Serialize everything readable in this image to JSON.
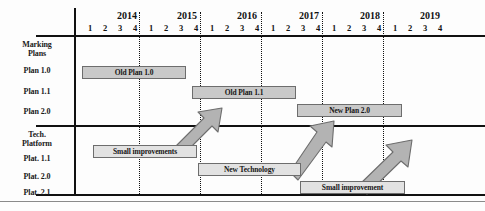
{
  "diagram": {
    "axis": {
      "years": [
        "2014",
        "2015",
        "2016",
        "2017",
        "2018",
        "2019"
      ],
      "quarters": [
        "1",
        "2",
        "3",
        "4"
      ]
    },
    "groups": [
      {
        "name": "marking-plans",
        "label_line1": "Marking",
        "label_line2": "Plans",
        "rows": [
          {
            "label": "Plan 1.0"
          },
          {
            "label": "Plan 1.1"
          },
          {
            "label": "Plan 2.0"
          }
        ]
      },
      {
        "name": "tech-platform",
        "label_line1": "Tech.",
        "label_line2": "Platform",
        "rows": [
          {
            "label": "Plat. 1.1"
          },
          {
            "label": "Plat. 2.0"
          },
          {
            "label": "Plat. 2.1"
          }
        ]
      }
    ],
    "bars": [
      {
        "name": "bar-old-plan-1-0",
        "label": "Old Plan 1.0",
        "row": "Plan 1.0",
        "tone": "dark",
        "x": 82,
        "y": 66,
        "w": 104
      },
      {
        "name": "bar-old-plan-1-1",
        "label": "Old Plan 1.1",
        "row": "Plan 1.1",
        "tone": "dark",
        "x": 192,
        "y": 86,
        "w": 104
      },
      {
        "name": "bar-new-plan-2-0",
        "label": "New Plan 2.0",
        "row": "Plan 2.0",
        "tone": "dark",
        "x": 297,
        "y": 104,
        "w": 105
      },
      {
        "name": "bar-small-improvements",
        "label": "Small improvements",
        "row": "Plat. 1.1",
        "tone": "light",
        "x": 93,
        "y": 145,
        "w": 104
      },
      {
        "name": "bar-new-technology",
        "label": "New Technology",
        "row": "Plat. 2.0",
        "tone": "light",
        "x": 198,
        "y": 163,
        "w": 103
      },
      {
        "name": "bar-small-improvement",
        "label": "Small improvement",
        "row": "Plat. 2.1",
        "tone": "light",
        "x": 300,
        "y": 181,
        "w": 105
      }
    ],
    "arrows": [
      {
        "name": "arrow-plat-1-1-to-plan-1-1",
        "x1": 179,
        "y1": 152,
        "x2": 223,
        "y2": 105
      },
      {
        "name": "arrow-plat-2-0-to-plan-2-0",
        "x1": 293,
        "y1": 177,
        "x2": 329,
        "y2": 121
      },
      {
        "name": "arrow-plat-2-1-to-plan-2-0",
        "x1": 362,
        "y1": 192,
        "x2": 417,
        "y2": 140
      }
    ],
    "colors": {
      "bar_fill_dark": "#c9c9c9",
      "bar_fill_light": "#e2e2e2",
      "bar_border": "#6d6d6d",
      "arrow_fill": "#b3b3b3",
      "arrow_border": "#6d6d6d",
      "axis": "#111111",
      "background": "#fdfdfd"
    }
  }
}
